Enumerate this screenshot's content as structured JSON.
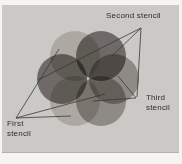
{
  "figure": {
    "page_color": "#f5f4f1",
    "panel_color": "#cbc9c6",
    "line_color": "#3a3835",
    "line_width": 0.8,
    "circle_radius": 25,
    "labels": {
      "first": "First\nstencil",
      "second": "Second stencil",
      "third": "Third\nstencil"
    },
    "stencils": [
      {
        "name": "first-stencil",
        "color": "#d9d6d1",
        "circles": [
          [
            75,
            56
          ],
          [
            75,
            101
          ]
        ]
      },
      {
        "name": "second-stencil",
        "color": "#8b8784",
        "circles": [
          [
            101,
            56
          ],
          [
            62,
            79
          ]
        ]
      },
      {
        "name": "third-stencil",
        "color": "#b3afab",
        "circles": [
          [
            114,
            79
          ],
          [
            101,
            101
          ]
        ]
      }
    ],
    "leader_lines": [
      {
        "from": "second-stencil-vertex",
        "x1": 141,
        "y1": 28,
        "x2": 111,
        "y2": 57
      },
      {
        "from": "second-stencil-vertex",
        "x1": 141,
        "y1": 28,
        "x2": 38,
        "y2": 80
      },
      {
        "from": "second-stencil-vertex",
        "x1": 141,
        "y1": 28,
        "x2": 137,
        "y2": 97
      },
      {
        "from": "third-stencil-vertex",
        "x1": 136,
        "y1": 98,
        "x2": 118,
        "y2": 76
      },
      {
        "from": "third-stencil-vertex",
        "x1": 136,
        "y1": 98,
        "x2": 93,
        "y2": 101
      },
      {
        "from": "first-stencil-vertex",
        "x1": 16,
        "y1": 118,
        "x2": 59,
        "y2": 49
      },
      {
        "from": "first-stencil-vertex",
        "x1": 16,
        "y1": 118,
        "x2": 71,
        "y2": 116
      },
      {
        "from": "first-stencil-vertex",
        "x1": 16,
        "y1": 118,
        "x2": 105,
        "y2": 94
      }
    ]
  }
}
